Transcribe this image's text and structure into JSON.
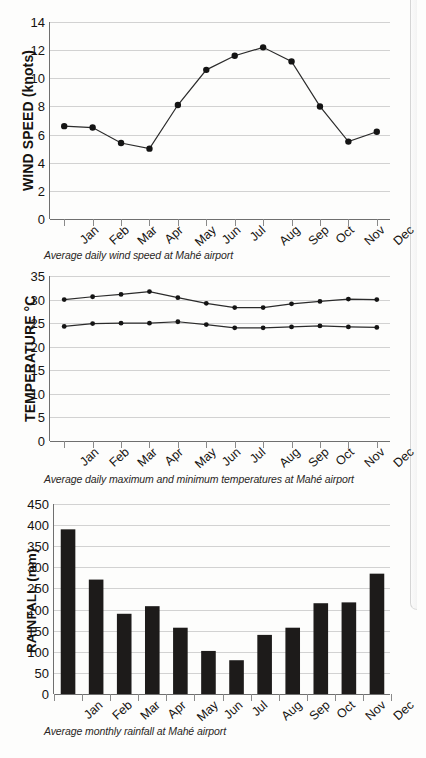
{
  "figures": [
    {
      "id": "wind",
      "ylabel": "WIND SPEED (knots)",
      "caption": "Average daily wind speed at Mahé airport",
      "yticks": [
        "0",
        "2",
        "4",
        "6",
        "8",
        "10",
        "12",
        "14"
      ],
      "months": [
        "Jan",
        "Feb",
        "Mar",
        "Apr",
        "May",
        "Jun",
        "Jul",
        "Aug",
        "Sep",
        "Oct",
        "Nov",
        "Dec"
      ]
    },
    {
      "id": "temp",
      "ylabel": "TEMPERATURE °C",
      "caption": "Average daily maximum and minimum temperatures at Mahé airport",
      "yticks": [
        "0",
        "5",
        "10",
        "15",
        "20",
        "25",
        "30",
        "35"
      ],
      "months": [
        "Jan",
        "Feb",
        "Mar",
        "Apr",
        "May",
        "Jun",
        "Jul",
        "Aug",
        "Sep",
        "Oct",
        "Nov",
        "Dec"
      ]
    },
    {
      "id": "rain",
      "ylabel": "RAINFALL (mm)",
      "caption": "Average monthly rainfall at Mahé airport",
      "yticks": [
        "0",
        "50",
        "100",
        "150",
        "200",
        "250",
        "300",
        "350",
        "400",
        "450"
      ],
      "months": [
        "Jan",
        "Feb",
        "Mar",
        "Apr",
        "May",
        "Jun",
        "Jul",
        "Aug",
        "Sep",
        "Oct",
        "Nov",
        "Dec"
      ]
    }
  ],
  "chart_data": [
    {
      "type": "line",
      "title": "",
      "caption": "Average daily wind speed at Mahé airport",
      "xlabel": "",
      "ylabel": "WIND SPEED (knots)",
      "categories": [
        "Jan",
        "Feb",
        "Mar",
        "Apr",
        "May",
        "Jun",
        "Jul",
        "Aug",
        "Sep",
        "Oct",
        "Nov",
        "Dec"
      ],
      "values": [
        6.6,
        6.5,
        5.4,
        5.0,
        8.1,
        10.6,
        11.6,
        12.2,
        11.2,
        8.0,
        5.5,
        6.2
      ],
      "ylim": [
        0,
        14
      ],
      "ytick_step": 2,
      "grid": true,
      "markers": "filled-circle",
      "legend": "none"
    },
    {
      "type": "line",
      "title": "",
      "caption": "Average daily maximum and minimum temperatures at Mahé airport",
      "xlabel": "",
      "ylabel": "TEMPERATURE °C",
      "categories": [
        "Jan",
        "Feb",
        "Mar",
        "Apr",
        "May",
        "Jun",
        "Jul",
        "Aug",
        "Sep",
        "Oct",
        "Nov",
        "Dec"
      ],
      "series": [
        {
          "name": "Average daily maximum temperature",
          "values": [
            30.0,
            30.6,
            31.1,
            31.7,
            30.4,
            29.2,
            28.3,
            28.3,
            29.1,
            29.6,
            30.1,
            30.0
          ]
        },
        {
          "name": "Average daily minimum temperature",
          "values": [
            24.3,
            24.9,
            25.0,
            25.0,
            25.3,
            24.7,
            24.0,
            24.0,
            24.2,
            24.4,
            24.2,
            24.1
          ]
        }
      ],
      "ylim": [
        0,
        35
      ],
      "ytick_step": 5,
      "grid": true,
      "markers": "filled-circle",
      "legend": "none"
    },
    {
      "type": "bar",
      "title": "",
      "caption": "Average monthly rainfall at Mahé airport",
      "xlabel": "",
      "ylabel": "RAINFALL (mm)",
      "categories": [
        "Jan",
        "Feb",
        "Mar",
        "Apr",
        "May",
        "Jun",
        "Jul",
        "Aug",
        "Sep",
        "Oct",
        "Nov",
        "Dec"
      ],
      "values": [
        390,
        271,
        190,
        208,
        157,
        102,
        80,
        140,
        157,
        215,
        217,
        285
      ],
      "ylim": [
        0,
        450
      ],
      "ytick_step": 50,
      "grid": true,
      "bar_color": "#1d1b1a",
      "legend": "none"
    }
  ]
}
